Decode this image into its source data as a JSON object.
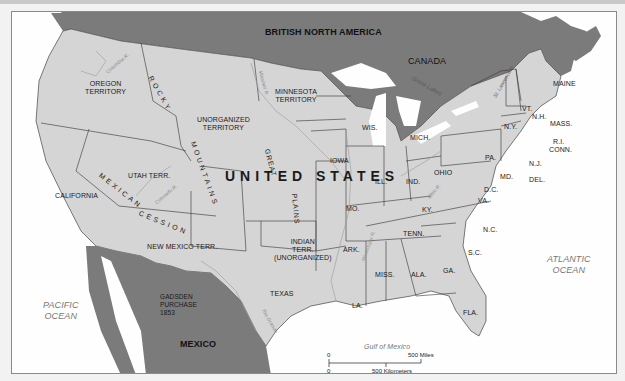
{
  "map": {
    "title": "United States, mid-1850s",
    "colors": {
      "us_land": "#d5d5d5",
      "foreign_land": "#7b7b7b",
      "water": "#fefefe",
      "border": "#333333",
      "river": "#9a9a9a"
    },
    "country_labels": {
      "united_states": "UNITED STATES",
      "british_north_america": "BRITISH NORTH AMERICA",
      "canada": "CANADA",
      "mexico": "MEXICO"
    },
    "region_labels": {
      "oregon": "OREGON\nTERRITORY",
      "oregon_line1": "OREGON",
      "oregon_line2": "TERRITORY",
      "minnesota_line1": "MINNESOTA",
      "minnesota_line2": "TERRITORY",
      "unorganized_line1": "UNORGANIZED",
      "unorganized_line2": "TERRITORY",
      "utah": "UTAH TERR.",
      "new_mexico": "NEW MEXICO TERR.",
      "california": "CALIFORNIA",
      "indian_line1": "INDIAN",
      "indian_line2": "TERR.",
      "indian_line3": "(UNORGANIZED)",
      "gadsden_line1": "GADSDEN",
      "gadsden_line2": "PURCHASE",
      "gadsden_line3": "1853",
      "texas": "TEXAS",
      "mexican_cession_1": "MEXICAN",
      "mexican_cession_2": "CESSION",
      "rocky_1": "ROCKY",
      "rocky_2": "MOUNTAINS",
      "great_plains_1": "GREAT",
      "great_plains_2": "PLAINS"
    },
    "states": [
      {
        "id": "maine",
        "label": "MAINE"
      },
      {
        "id": "vt",
        "label": "VT."
      },
      {
        "id": "nh",
        "label": "N.H."
      },
      {
        "id": "mass",
        "label": "MASS."
      },
      {
        "id": "ri",
        "label": "R.I."
      },
      {
        "id": "conn",
        "label": "CONN."
      },
      {
        "id": "ny",
        "label": "N.Y."
      },
      {
        "id": "nj",
        "label": "N.J."
      },
      {
        "id": "pa",
        "label": "PA."
      },
      {
        "id": "del",
        "label": "DEL."
      },
      {
        "id": "md",
        "label": "MD."
      },
      {
        "id": "dc",
        "label": "D.C."
      },
      {
        "id": "va",
        "label": "VA."
      },
      {
        "id": "nc",
        "label": "N.C."
      },
      {
        "id": "sc",
        "label": "S.C."
      },
      {
        "id": "ga",
        "label": "GA."
      },
      {
        "id": "fla",
        "label": "FLA."
      },
      {
        "id": "ala",
        "label": "ALA."
      },
      {
        "id": "miss",
        "label": "MISS."
      },
      {
        "id": "la",
        "label": "LA."
      },
      {
        "id": "tenn",
        "label": "TENN."
      },
      {
        "id": "ky",
        "label": "KY."
      },
      {
        "id": "ohio",
        "label": "OHIO"
      },
      {
        "id": "ind",
        "label": "IND."
      },
      {
        "id": "ill",
        "label": "ILL."
      },
      {
        "id": "mich",
        "label": "MICH."
      },
      {
        "id": "wis",
        "label": "WIS."
      },
      {
        "id": "iowa",
        "label": "IOWA"
      },
      {
        "id": "mo",
        "label": "MO."
      },
      {
        "id": "ark",
        "label": "ARK."
      }
    ],
    "water_labels": {
      "pacific_1": "PACIFIC",
      "pacific_2": "OCEAN",
      "atlantic_1": "ATLANTIC",
      "atlantic_2": "OCEAN",
      "gulf": "Gulf of Mexico"
    },
    "river_labels": {
      "columbia": "Columbia R.",
      "missouri": "Missouri R.",
      "colorado": "Colorado R.",
      "rio_grande": "Rio Grande",
      "mississippi": "Mississippi R.",
      "ohio": "Ohio R.",
      "great_lakes": "Great Lakes",
      "st_lawrence": "St. Lawrence R."
    },
    "scale_bar": {
      "miles_zero": "0",
      "miles_label": "500 Miles",
      "km_zero": "0",
      "km_label": "500 Kilometers"
    }
  }
}
